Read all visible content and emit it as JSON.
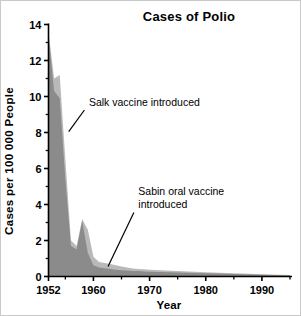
{
  "chart_data": {
    "type": "area",
    "title": "Cases of Polio",
    "xlabel": "Year",
    "ylabel": "Cases per 100 000 People",
    "xlim": [
      1952,
      1995
    ],
    "ylim": [
      0,
      14
    ],
    "grid": false,
    "legend": "none",
    "x_ticks_major": [
      1952,
      1960,
      1970,
      1980,
      1990
    ],
    "x_tick_labels": [
      "1952",
      "1960",
      "1970",
      "1980",
      "1990"
    ],
    "x_ticks_minor": [
      1955,
      1965,
      1975,
      1985,
      1995
    ],
    "y_ticks_major": [
      0,
      2,
      4,
      6,
      8,
      10,
      12,
      14
    ],
    "y_tick_labels": [
      "0",
      "2",
      "4",
      "6",
      "8",
      "10",
      "12",
      "14"
    ],
    "y_ticks_minor": [
      1,
      3,
      5,
      7,
      9,
      11,
      13
    ],
    "x": [
      1952,
      1953,
      1954,
      1955,
      1956,
      1957,
      1958,
      1959,
      1960,
      1961,
      1962,
      1963,
      1964,
      1965,
      1966,
      1967,
      1968,
      1969,
      1970,
      1972,
      1975,
      1980,
      1985,
      1990,
      1995
    ],
    "series": [
      {
        "name": "light-area",
        "color": "#b9b9b9",
        "values": [
          13.6,
          11.0,
          11.2,
          6.5,
          2.0,
          1.7,
          3.2,
          2.6,
          1.1,
          0.8,
          0.75,
          0.7,
          0.62,
          0.55,
          0.5,
          0.45,
          0.42,
          0.4,
          0.38,
          0.35,
          0.3,
          0.24,
          0.18,
          0.13,
          0.08
        ]
      },
      {
        "name": "dark-area",
        "color": "#8b8b8b",
        "values": [
          13.4,
          10.3,
          9.9,
          5.4,
          1.7,
          1.5,
          3.1,
          1.3,
          0.62,
          0.5,
          0.46,
          0.42,
          0.38,
          0.35,
          0.33,
          0.31,
          0.3,
          0.28,
          0.27,
          0.25,
          0.22,
          0.18,
          0.14,
          0.1,
          0.06
        ]
      }
    ],
    "annotations": [
      {
        "name": "salk",
        "lines": [
          "Salk vaccine introduced"
        ],
        "text_x": 1959.2,
        "text_y": 9.45,
        "leader_from_x": 1958.4,
        "leader_from_y": 9.25,
        "leader_to_x": 1955.6,
        "leader_to_y": 8.05
      },
      {
        "name": "sabin",
        "lines": [
          "Sabin oral vaccine",
          "introduced"
        ],
        "text_x": 1968.0,
        "text_y": 4.55,
        "leader_from_x": 1967.2,
        "leader_from_y": 3.55,
        "leader_to_x": 1962.6,
        "leader_to_y": 0.55
      }
    ]
  }
}
